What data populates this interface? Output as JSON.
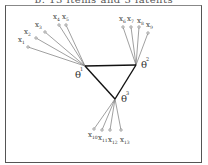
{
  "title": "b. 13 items and 3 latents",
  "latents": [
    {
      "id": "1",
      "label": "θ",
      "superscript": "1"
    },
    {
      "id": "2",
      "label": "θ",
      "superscript": "2"
    },
    {
      "id": "3",
      "label": "θ",
      "superscript": "3"
    }
  ],
  "latent_links": [
    [
      "1",
      "2"
    ],
    [
      "2",
      "3"
    ],
    [
      "3",
      "1"
    ]
  ],
  "items": [
    {
      "label": "x",
      "subscript": "1",
      "latent": "1"
    },
    {
      "label": "x",
      "subscript": "2",
      "latent": "1"
    },
    {
      "label": "x",
      "subscript": "3",
      "latent": "1"
    },
    {
      "label": "x",
      "subscript": "4",
      "latent": "1"
    },
    {
      "label": "x",
      "subscript": "5",
      "latent": "1"
    },
    {
      "label": "x",
      "subscript": "6",
      "latent": "2"
    },
    {
      "label": "x",
      "subscript": "7",
      "latent": "2"
    },
    {
      "label": "x",
      "subscript": "8",
      "latent": "2"
    },
    {
      "label": "x",
      "subscript": "9",
      "latent": "2"
    },
    {
      "label": "x",
      "subscript": "10",
      "latent": "3"
    },
    {
      "label": "x",
      "subscript": "11",
      "latent": "3"
    },
    {
      "label": "x",
      "subscript": "12",
      "latent": "3"
    },
    {
      "label": "x",
      "subscript": "13",
      "latent": "3"
    }
  ]
}
